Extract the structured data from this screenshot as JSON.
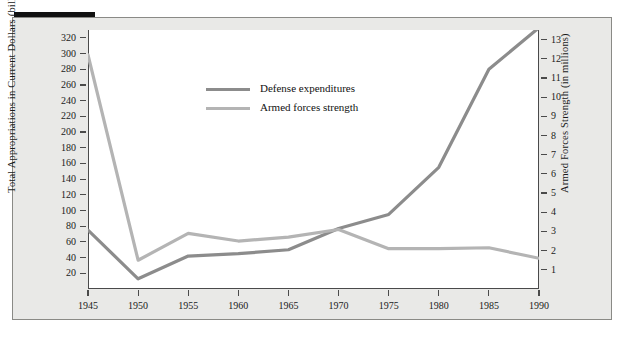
{
  "figure": {
    "background_color": "#e9e9e7",
    "plot_background_color": "#ffffff",
    "border_color": "#8a8a86",
    "axis_color": "#4a4a4a",
    "decor_bar_color": "#111111"
  },
  "chart_data": {
    "type": "line",
    "title": "",
    "subtitle": "",
    "xlabel": "",
    "ylabel": "Total Appropriations in Current Dollars (billions)",
    "y2label": "Armed Forces Strength (in millions)",
    "x": [
      1945,
      1950,
      1955,
      1960,
      1965,
      1970,
      1975,
      1980,
      1985,
      1990
    ],
    "categories": [
      "1945",
      "1950",
      "1955",
      "1960",
      "1965",
      "1970",
      "1975",
      "1980",
      "1985",
      "1990"
    ],
    "xlim": [
      1945,
      1990
    ],
    "ylim": [
      0,
      330
    ],
    "y2lim": [
      0,
      13.5
    ],
    "grid": false,
    "legend_position": "top-left-inside",
    "xticks": [
      "1945",
      "1950",
      "1955",
      "1960",
      "1965",
      "1970",
      "1975",
      "1980",
      "1985",
      "1990"
    ],
    "yticks": [
      "20",
      "40",
      "60",
      "80",
      "100",
      "120",
      "140",
      "160",
      "180",
      "200",
      "220",
      "240",
      "260",
      "280",
      "300",
      "320"
    ],
    "y2ticks": [
      "1",
      "2",
      "3",
      "4",
      "5",
      "6",
      "7",
      "8",
      "9",
      "10",
      "11",
      "12",
      "13"
    ],
    "series": [
      {
        "name": "Defense expenditures",
        "axis": "left",
        "units": "billions of current dollars",
        "color": "#8c8c8c",
        "values": [
          75,
          13,
          42,
          45,
          50,
          77,
          95,
          155,
          280,
          333
        ]
      },
      {
        "name": "Armed forces strength",
        "axis": "right",
        "units": "millions",
        "color": "#b4b4b4",
        "values": [
          12.2,
          1.5,
          2.9,
          2.5,
          2.7,
          3.1,
          2.1,
          2.1,
          2.15,
          1.6
        ]
      }
    ]
  },
  "legend": {
    "items": [
      {
        "label": "Defense expenditures",
        "color": "#8c8c8c"
      },
      {
        "label": "Armed forces strength",
        "color": "#b4b4b4"
      }
    ]
  }
}
